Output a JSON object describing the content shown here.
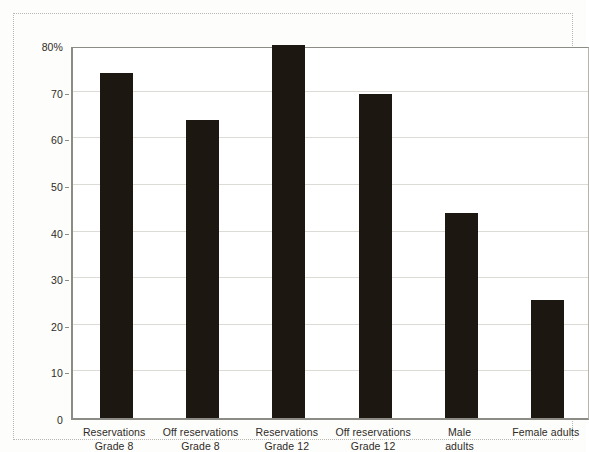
{
  "chart_data": {
    "type": "bar",
    "title": "",
    "subtitle": "",
    "xlabel": "",
    "ylabel": "",
    "ylim": [
      0,
      80
    ],
    "grid": true,
    "legend": "none",
    "y_ticks": [
      {
        "value": 0,
        "label": "0"
      },
      {
        "value": 10,
        "label": "10"
      },
      {
        "value": 20,
        "label": "20"
      },
      {
        "value": 30,
        "label": "30"
      },
      {
        "value": 40,
        "label": "40"
      },
      {
        "value": 50,
        "label": "50"
      },
      {
        "value": 60,
        "label": "60"
      },
      {
        "value": 70,
        "label": "70"
      },
      {
        "value": 80,
        "label": "80%"
      }
    ],
    "categories": [
      "Reservations Grade 8",
      "Off reservations Grade 8",
      "Reservations Grade 12",
      "Off reservations Grade 12",
      "Male adults",
      "Female adults"
    ],
    "category_lines": [
      [
        "Reservations",
        "Grade 8"
      ],
      [
        "Off reservations",
        "Grade 8"
      ],
      [
        "Reservations",
        "Grade 12"
      ],
      [
        "Off reservations",
        "Grade 12"
      ],
      [
        "Male",
        "adults"
      ],
      [
        "Female adults",
        ""
      ]
    ],
    "values": [
      74,
      64,
      80,
      69.5,
      44,
      25.3
    ],
    "bar_color": "#1d1711",
    "plot_background": "#ffffff",
    "grid_color": "#dddbd6",
    "axis_color": "#8d8b86"
  }
}
